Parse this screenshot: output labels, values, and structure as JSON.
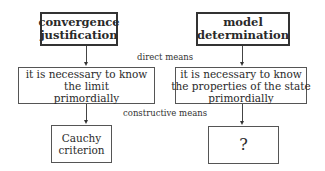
{
  "diagram": {
    "columns": [
      {
        "top": {
          "lines": [
            "convergence",
            "justification"
          ]
        },
        "middle": {
          "lines": [
            "it is necessary to know",
            "the limit",
            "primordially"
          ]
        },
        "bottom": {
          "lines": [
            "Cauchy",
            "criterion"
          ]
        }
      },
      {
        "top": {
          "lines": [
            "model",
            "determination"
          ]
        },
        "middle": {
          "lines": [
            "it is necessary to know",
            "the properties of the state",
            "primordially"
          ]
        },
        "bottom": {
          "lines": [
            "?"
          ]
        }
      }
    ],
    "labels": {
      "direct": "direct means",
      "constructive": "constructive means"
    }
  }
}
